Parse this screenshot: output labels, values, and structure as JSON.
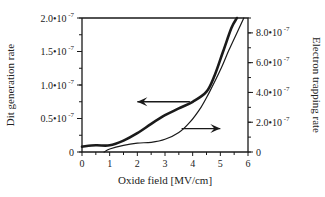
{
  "chart_data": {
    "type": "line",
    "title": "",
    "xlabel": "Oxide field [MV/cm]",
    "ylabel": "Dit generation rate",
    "ylabel_right": "Electron trapping rate",
    "xlim": [
      0,
      6
    ],
    "ylim": [
      0,
      2e-07
    ],
    "ylim_right": [
      0,
      9e-07
    ],
    "grid": false,
    "legend": "none (arrows indicate axis)",
    "x_ticks": [
      "0",
      "1",
      "2",
      "3",
      "4",
      "5",
      "6"
    ],
    "y_ticks_left": [
      {
        "value": 0,
        "label": "0"
      },
      {
        "value": 5e-08,
        "label": "0.5•10",
        "exp": "-7"
      },
      {
        "value": 1e-07,
        "label": "1.0•10",
        "exp": "-7"
      },
      {
        "value": 1.5e-07,
        "label": "1.5•10",
        "exp": "-7"
      },
      {
        "value": 2e-07,
        "label": "2.0•10",
        "exp": "-7"
      }
    ],
    "y_ticks_right": [
      {
        "value": 0,
        "label": "0"
      },
      {
        "value": 2e-07,
        "label": "2.0•10",
        "exp": "-7"
      },
      {
        "value": 4e-07,
        "label": "4.0•10",
        "exp": "-7"
      },
      {
        "value": 6e-07,
        "label": "6.0•10",
        "exp": "-7"
      },
      {
        "value": 8e-07,
        "label": "8.0•10",
        "exp": "-7"
      }
    ],
    "series": [
      {
        "name": "Dit generation rate",
        "axis": "left",
        "style": "thick",
        "x": [
          0,
          0.5,
          1.0,
          1.5,
          2.0,
          2.5,
          3.0,
          3.5,
          4.0,
          4.5,
          4.8,
          5.1,
          5.4,
          5.6
        ],
        "values": [
          8e-09,
          1e-08,
          1e-08,
          1.7e-08,
          2.8e-08,
          4.2e-08,
          5.5e-08,
          6.5e-08,
          7.5e-08,
          9e-08,
          1.15e-07,
          1.5e-07,
          1.85e-07,
          2e-07
        ]
      },
      {
        "name": "Electron trapping rate",
        "axis": "right",
        "style": "thin",
        "x": [
          0.8,
          1.0,
          1.5,
          2.0,
          2.5,
          3.0,
          3.5,
          3.9,
          4.3,
          4.6,
          5.0,
          5.3,
          5.6,
          5.85
        ],
        "values": [
          0,
          2e-08,
          4.5e-08,
          6e-08,
          6.5e-08,
          8.5e-08,
          1.3e-07,
          2e-07,
          3e-07,
          4e-07,
          5.5e-07,
          6.8e-07,
          8e-07,
          9e-07
        ]
      }
    ],
    "annotations": [
      {
        "type": "arrow",
        "direction": "left",
        "from": [
          3.9,
          7.5e-08
        ],
        "to": [
          2.0,
          7.5e-08
        ],
        "meaning": "Dit curve reads left axis"
      },
      {
        "type": "arrow",
        "direction": "right",
        "from": [
          3.6,
          3.5e-08
        ],
        "to": [
          5.0,
          3.5e-08
        ],
        "meaning": "Trapping curve reads right axis"
      }
    ]
  },
  "colors": {
    "line": "#1a1a1a",
    "background": "#ffffff"
  }
}
